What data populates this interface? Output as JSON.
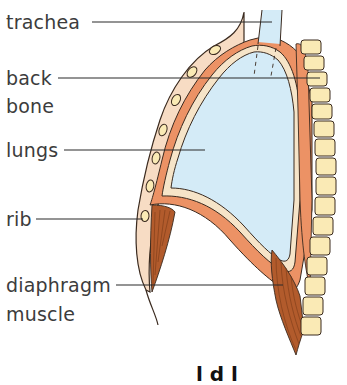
{
  "diagram": {
    "labels": {
      "trachea": "trachea",
      "back_bone_line1": "back",
      "back_bone_line2": "bone",
      "lungs": "lungs",
      "rib": "rib",
      "diaphragm_line1": "diaphragm",
      "diaphragm_line2": "muscle"
    },
    "cropped_caption": "l d l"
  },
  "colors": {
    "lung": "#d4ebf7",
    "pleura": "#f6e4c8",
    "muscle_orange": "#ec9265",
    "muscle_dark": "#b25b2c",
    "vertebra": "#faeab5",
    "skin": "#f7dcc4",
    "outline": "#3a2a1f",
    "leader_line": "#2b2b2b",
    "label_text": "#3c3c3c"
  }
}
